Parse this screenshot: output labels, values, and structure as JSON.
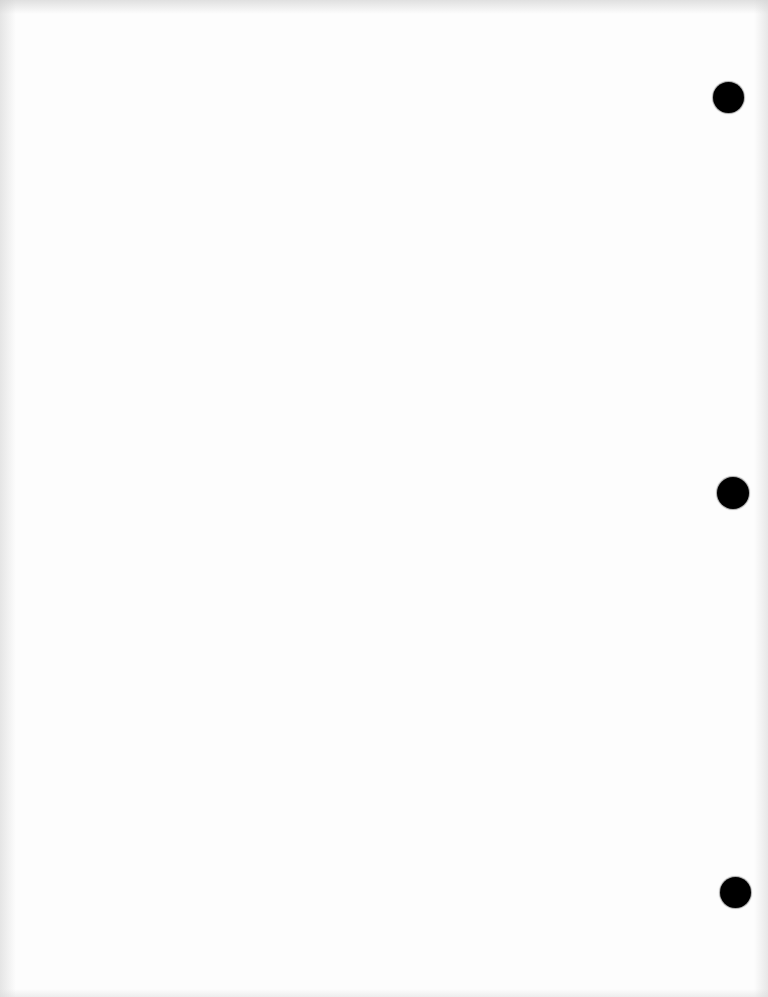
{
  "document": {
    "type": "blank-page",
    "background_color": "#fdfdfd",
    "content_text": ""
  },
  "punch_holes": [
    {
      "id": "top",
      "cx": 728,
      "cy": 97,
      "diameter": 31,
      "color": "#000000"
    },
    {
      "id": "middle",
      "cx": 733,
      "cy": 493,
      "diameter": 32,
      "color": "#000000"
    },
    {
      "id": "bottom",
      "cx": 735,
      "cy": 892,
      "diameter": 31,
      "color": "#000000"
    }
  ]
}
